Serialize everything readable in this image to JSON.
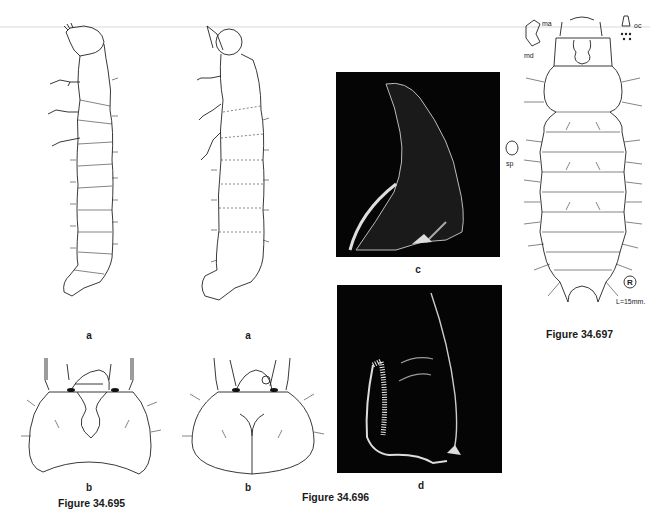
{
  "figures": [
    {
      "id": "fig-34-695",
      "caption": "Figure 34.695",
      "panels": [
        {
          "label": "a",
          "description": "larva, lateral view"
        },
        {
          "label": "b",
          "description": "head capsule, dorsal view"
        }
      ]
    },
    {
      "id": "fig-34-696",
      "caption": "Figure 34.696",
      "panels": [
        {
          "label": "a",
          "description": "larva, lateral view"
        },
        {
          "label": "b",
          "description": "head capsule, dorsal view"
        },
        {
          "label": "c",
          "description": "SEM micrograph of mandible"
        },
        {
          "label": "d",
          "description": "SEM micrograph of mandible"
        }
      ]
    },
    {
      "id": "fig-34-697",
      "caption": "Figure 34.697",
      "panels": [],
      "annotations": {
        "mouthpart_ma": "ma",
        "mouthpart_md": "md",
        "ocelli": "oc",
        "spiracle": "sp",
        "scale": "L=15mm.",
        "mark": "R"
      }
    }
  ],
  "colors": {
    "ink": "#222222",
    "sem_background": "#050505",
    "page": "#ffffff"
  }
}
